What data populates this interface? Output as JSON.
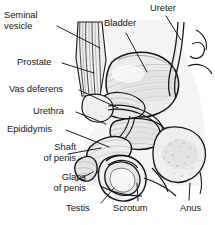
{
  "figure": {
    "colors": {
      "ink": "#15181c",
      "line": "#1a1d21",
      "background": "#ffffff",
      "shade_light": "#e8e8e8",
      "shade_mid": "#d2d2d2",
      "shade_dark": "#b6b6b6",
      "leader": "#101317"
    }
  },
  "labels": [
    {
      "id": "seminal-vesicle",
      "line1": "Seminal",
      "line2": "vesicle",
      "align": "l",
      "x": 4,
      "y": 10,
      "w": 70
    },
    {
      "id": "bladder",
      "line1": "Bladder",
      "line2": "",
      "align": "l",
      "x": 104,
      "y": 18,
      "w": 52
    },
    {
      "id": "ureter",
      "line1": "Ureter",
      "line2": "",
      "align": "l",
      "x": 150,
      "y": 3,
      "w": 48
    },
    {
      "id": "prostate",
      "line1": "Prostate",
      "line2": "",
      "align": "l",
      "x": 17,
      "y": 57,
      "w": 58
    },
    {
      "id": "vas-deferens",
      "line1": "Vas deferens",
      "line2": "",
      "align": "l",
      "x": 9,
      "y": 84,
      "w": 80
    },
    {
      "id": "urethra",
      "line1": "Urethra",
      "line2": "",
      "align": "l",
      "x": 33,
      "y": 106,
      "w": 55
    },
    {
      "id": "epididymis",
      "line1": "Epididymis",
      "line2": "",
      "align": "l",
      "x": 7,
      "y": 124,
      "w": 70
    },
    {
      "id": "shaft-of-penis",
      "line1": "Shaft",
      "line2": "of penis",
      "align": "r",
      "x": 14,
      "y": 142,
      "w": 62
    },
    {
      "id": "glans-of-penis",
      "line1": "Glans",
      "line2": "of penis",
      "align": "r",
      "x": 24,
      "y": 172,
      "w": 62
    },
    {
      "id": "testis",
      "line1": "Testis",
      "line2": "",
      "align": "l",
      "x": 66,
      "y": 203,
      "w": 42
    },
    {
      "id": "scrotum",
      "line1": "Scrotum",
      "line2": "",
      "align": "l",
      "x": 113,
      "y": 203,
      "w": 52
    },
    {
      "id": "anus",
      "line1": "Anus",
      "line2": "",
      "align": "l",
      "x": 180,
      "y": 203,
      "w": 34
    }
  ],
  "leaders": [
    {
      "id": "leader-seminal-vesicle",
      "d": "M57 26 L100 48"
    },
    {
      "id": "leader-bladder",
      "d": "M126 33 L147 72"
    },
    {
      "id": "leader-ureter",
      "d": "M166 16 L181 40"
    },
    {
      "id": "leader-prostate",
      "d": "M62 63 L94 73"
    },
    {
      "id": "leader-vas-deferens",
      "d": "M79 90 L118 108"
    },
    {
      "id": "leader-urethra",
      "d": "M76 112 L106 124"
    },
    {
      "id": "leader-epididymis",
      "d": "M66 130 L109 147"
    },
    {
      "id": "leader-shaft-of-penis",
      "d": "M68 154 L101 148"
    },
    {
      "id": "leader-glans-of-penis",
      "d": "M76 181 L93 172"
    },
    {
      "id": "leader-testis",
      "d": "M101 203 L114 188"
    },
    {
      "id": "leader-scrotum",
      "d": "M138 201 L137 183"
    },
    {
      "id": "leader-anus",
      "d": "M189 200 L190 183"
    }
  ]
}
